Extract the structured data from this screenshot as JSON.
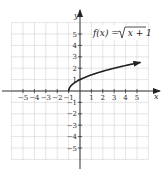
{
  "chart_data": {
    "type": "line",
    "title": "",
    "function_label": "f(x) = √(x + 1)",
    "function_label_parts": {
      "lhs": "f(x) = ",
      "radicand": "x + 1"
    },
    "xlabel": "x",
    "ylabel": "y",
    "xlim": [
      -6,
      6
    ],
    "ylim": [
      -6,
      6
    ],
    "grid": true,
    "x_ticks": [
      -5,
      -4,
      -3,
      -2,
      -1,
      1,
      2,
      3,
      4,
      5
    ],
    "y_ticks": [
      5,
      4,
      3,
      2,
      1,
      -1,
      -2,
      -3,
      -4,
      -5
    ],
    "x_tick_labels": [
      "−5",
      "−4",
      "−3",
      "−2",
      "−1",
      "1",
      "2",
      "3",
      "4",
      "5"
    ],
    "y_tick_labels": [
      "5",
      "4",
      "3",
      "2",
      "1",
      "−1",
      "−2",
      "−3",
      "−4",
      "−5"
    ],
    "series": [
      {
        "name": "f(x) = √(x + 1)",
        "x": [
          -1,
          -0.75,
          0,
          1,
          2,
          3,
          4,
          5,
          6
        ],
        "y": [
          0,
          0.5,
          1,
          1.414,
          1.732,
          2,
          2.236,
          2.449,
          2.646
        ],
        "end_arrow": true
      }
    ],
    "colors": {
      "curve": "#222222",
      "axes": "#333333",
      "grid": "#bbbbbb"
    }
  }
}
